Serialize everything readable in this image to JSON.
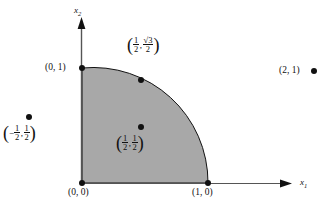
{
  "figure": {
    "type": "geometric-diagram",
    "background_color": "#ffffff",
    "shade_color": "#a8a8a8",
    "stroke_color": "#111111",
    "axes": {
      "x_label": "x",
      "x_subscript": "1",
      "y_label": "x",
      "y_subscript": "2"
    },
    "points": [
      {
        "id": "origin",
        "label": "(0, 0)",
        "coords": [
          0,
          0
        ],
        "marker": true
      },
      {
        "id": "x-intercept",
        "label": "(1, 0)",
        "coords": [
          1,
          0
        ],
        "marker": true
      },
      {
        "id": "y-intercept",
        "label": "(0, 1)",
        "coords": [
          0,
          1
        ],
        "marker": true
      },
      {
        "id": "arc-point",
        "label_parts": {
          "open": "(",
          "first_num": "1",
          "first_den": "2",
          "comma": ",",
          "second_radicand": "3",
          "second_den": "2",
          "close": ")"
        },
        "coords": [
          0.5,
          0.866
        ],
        "marker": true
      },
      {
        "id": "interior-point",
        "label_parts": {
          "open": "(",
          "first_num": "1",
          "first_den": "2",
          "comma": ",",
          "second_num": "1",
          "second_den": "2",
          "close": ")"
        },
        "coords": [
          0.5,
          0.5
        ],
        "marker": true
      },
      {
        "id": "exterior-point-left",
        "label_parts": {
          "open": "(",
          "sign": "−",
          "first_num": "1",
          "first_den": "2",
          "comma": ",",
          "second_num": "1",
          "second_den": "2",
          "close": ")"
        },
        "coords": [
          -0.5,
          0.5
        ],
        "marker": true
      },
      {
        "id": "exterior-point-right",
        "label": "(2, 1)",
        "coords": [
          2,
          1
        ],
        "marker": true
      }
    ],
    "radicals": {
      "sqrt_symbol": "√"
    }
  }
}
